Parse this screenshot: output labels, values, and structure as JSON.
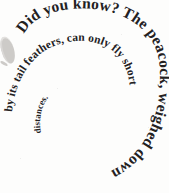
{
  "image": {
    "kind": "spiral-text-graphic",
    "full_text": "Did you know? The peacock, weighed down by its tail feathers, can only fly short distances.",
    "background_color": "#fdfdfc",
    "text_color": "#23211f",
    "width_px": 169,
    "height_px": 193
  },
  "spiral": {
    "direction": "clockwise-inward",
    "start_position": "upper-left",
    "turns": 2.4,
    "segments": [
      {
        "id": "turn-1",
        "text": "Did you know? The peacock, weighed down",
        "font_size_px": 15.5,
        "letter_spacing_px": 0.2
      },
      {
        "id": "turn-2",
        "text": "by its tail feathers, can only fly short",
        "font_size_px": 11.5,
        "letter_spacing_px": 0.1
      },
      {
        "id": "turn-3",
        "text": "distances.",
        "font_size_px": 9,
        "letter_spacing_px": 0
      }
    ]
  },
  "artifact": {
    "label": "scan-edge-mark",
    "description": "faint partial mark at left margin"
  }
}
